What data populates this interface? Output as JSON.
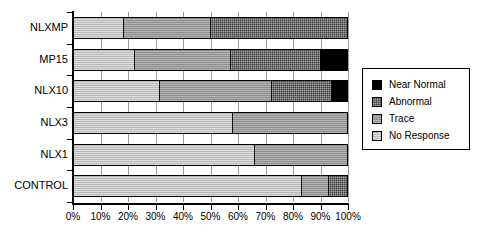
{
  "chart_data": {
    "type": "bar",
    "orientation": "horizontal",
    "stacked": true,
    "normalized": "100%",
    "title": "",
    "xlabel": "",
    "ylabel": "",
    "xlim": [
      0,
      100
    ],
    "grid": true,
    "legend_position": "right",
    "categories": [
      "NLXMP",
      "MP15",
      "NLX10",
      "NLX3",
      "NLX1",
      "CONTROL"
    ],
    "xticks": [
      0,
      10,
      20,
      30,
      40,
      50,
      60,
      70,
      80,
      90,
      100
    ],
    "xticklabels": [
      "0%",
      "10%",
      "20%",
      "30%",
      "40%",
      "50%",
      "60%",
      "70%",
      "80%",
      "90%",
      "100%"
    ],
    "series": [
      {
        "name": "No Response",
        "color": "#b7b7b7",
        "values": [
          18,
          22,
          31,
          58,
          66,
          83
        ]
      },
      {
        "name": "Trace",
        "color": "#8e8e8e",
        "values": [
          32,
          35,
          41,
          42,
          34,
          10
        ]
      },
      {
        "name": "Abnormal",
        "color": "#3b3b3b",
        "values": [
          50,
          33,
          22,
          0,
          0,
          7
        ]
      },
      {
        "name": "Near Normal",
        "color": "#000000",
        "values": [
          0,
          10,
          6,
          0,
          0,
          0
        ]
      }
    ]
  },
  "legend": {
    "entries": [
      {
        "label": "Near Normal",
        "color": "#000000"
      },
      {
        "label": "Abnormal",
        "color": "#3b3b3b"
      },
      {
        "label": "Trace",
        "color": "#8e8e8e"
      },
      {
        "label": "No Response",
        "color": "#b7b7b7"
      }
    ]
  }
}
